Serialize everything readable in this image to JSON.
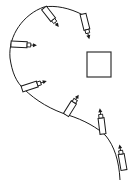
{
  "diagram": {
    "width": 134,
    "height": 182,
    "background": "#ffffff",
    "stroke_color": "#1a1a1a",
    "path": {
      "name": "question-mark-trajectory",
      "d": "M83,15 C70,8 55,5 44,7 C24,14 8,35 10,58 C12,72 16,82 24,89 C36,101 52,110 68,115 C84,120 98,128 106,136 C114,146 119,160 120,180"
    },
    "target": {
      "name": "square-target",
      "x": 87,
      "y": 52,
      "width": 24,
      "height": 25
    },
    "tools": [
      {
        "name": "tool-1",
        "x": 44,
        "y": 8,
        "angle": 52,
        "length": 24
      },
      {
        "name": "tool-2",
        "x": 83,
        "y": 14,
        "angle": 76,
        "length": 26
      },
      {
        "name": "tool-3",
        "x": 11,
        "y": 44,
        "angle": 3,
        "length": 26
      },
      {
        "name": "tool-4",
        "x": 22,
        "y": 89,
        "angle": -18,
        "length": 26
      },
      {
        "name": "tool-5",
        "x": 66,
        "y": 115,
        "angle": -58,
        "length": 24
      },
      {
        "name": "tool-6",
        "x": 103,
        "y": 134,
        "angle": -97,
        "length": 26
      },
      {
        "name": "tool-7",
        "x": 124,
        "y": 170,
        "angle": -100,
        "length": 26
      }
    ]
  }
}
